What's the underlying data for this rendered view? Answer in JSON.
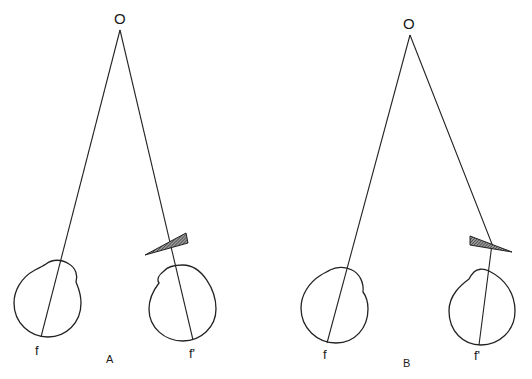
{
  "figure": {
    "background": "#ffffff",
    "line_color": "#222222",
    "panels": [
      {
        "id": "A",
        "label": "A",
        "object_label": "O",
        "left_fovea_label": "f",
        "right_fovea_label": "f'",
        "prism_orientation": "base-out (apex pointing left/nasal)"
      },
      {
        "id": "B",
        "label": "B",
        "object_label": "O",
        "left_fovea_label": "f",
        "right_fovea_label": "f'",
        "prism_orientation": "base-in (apex pointing right/temporal)"
      }
    ]
  }
}
